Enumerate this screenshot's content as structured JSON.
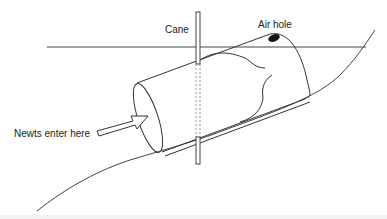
{
  "diagram": {
    "type": "newt bottle trap illustration",
    "labels": {
      "cane": "Cane",
      "air_hole": "Air hole",
      "entry": "Newts enter here"
    },
    "colors": {
      "line": "#333333",
      "air_hole_fill": "#111111",
      "background": "#ffffff"
    }
  }
}
